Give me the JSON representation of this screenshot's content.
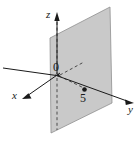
{
  "figure": {
    "type": "3d-coordinate-diagram",
    "background_color": "#ffffff",
    "plane": {
      "name": "shaded-plane",
      "fill_color": "#c8c8c8",
      "stroke_color": "#8a8a8a",
      "equation_value": "5",
      "corners": [
        [
          50,
          38
        ],
        [
          110,
          7
        ],
        [
          112,
          103
        ],
        [
          51,
          133
        ]
      ]
    },
    "axes": [
      {
        "name": "x-axis",
        "label": "x",
        "label_position": [
          12,
          90
        ],
        "arrow": "toward-lower-left",
        "color": "#1a1a1a"
      },
      {
        "name": "y-axis",
        "label": "y",
        "label_position": [
          128,
          104
        ],
        "arrow": "toward-right",
        "color": "#1a1a1a"
      },
      {
        "name": "z-axis",
        "label": "z",
        "label_position": [
          46,
          9
        ],
        "arrow": "toward-top",
        "color": "#1a1a1a"
      }
    ],
    "origin": {
      "label": "0",
      "position": [
        53,
        61
      ],
      "point": [
        60,
        74
      ]
    },
    "marked_point": {
      "label": "5",
      "label_position": [
        80,
        92
      ],
      "dot_position": [
        84,
        89
      ],
      "dot_color": "#1a1a1a",
      "on_axis": "y"
    },
    "line_styles": {
      "solid": "visible-axis-segment",
      "dashed": "hidden-axis-segment-behind-plane"
    }
  }
}
